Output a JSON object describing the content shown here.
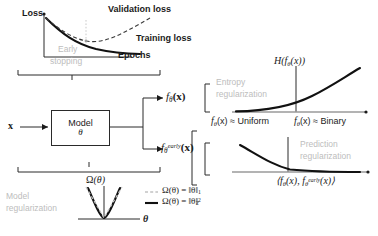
{
  "figure": {
    "panels": {
      "early_stopping": {
        "ylabel": "Loss",
        "xlabel": "Epochs",
        "series": [
          {
            "name": "Validation loss",
            "style": "dashed"
          },
          {
            "name": "Training loss",
            "style": "solid"
          }
        ],
        "marker_label_line1": "Early",
        "marker_label_line2": "stopping"
      },
      "model": {
        "input": "x",
        "box_title": "Model",
        "box_param": "θ",
        "output_top": "f",
        "output_top_sub": "θ",
        "output_top_arg": "(x)",
        "output_bottom": "f",
        "output_bottom_sub": "θ",
        "output_bottom_sup": "early",
        "output_bottom_arg": "(x)"
      },
      "model_regularization": {
        "label_line1": "Model",
        "label_line2": "regularization",
        "ylabel_f": "Ω",
        "ylabel_arg": "(θ)",
        "xlabel": "θ",
        "legend": [
          {
            "style": "dashed",
            "text_f": "Ω(θ)  =  ‖θ‖",
            "sub": "1",
            "sup": ""
          },
          {
            "style": "solid",
            "text_f": "Ω(θ)  =  ‖θ‖",
            "sub": "2",
            "sup": "2"
          }
        ]
      },
      "entropy_regularization": {
        "label_line1": "Entropy",
        "label_line2": "regularization",
        "ylabel_H": "H",
        "ylabel_arg": "(f",
        "ylabel_sub": "θ",
        "ylabel_tail": "(x))",
        "x_left_f": "f",
        "x_left_sub": "θ",
        "x_left_tail": "(x) ≈ Uniform",
        "x_right_f": "f",
        "x_right_sub": "θ",
        "x_right_tail": "(x) ≈ Binary"
      },
      "prediction_regularization": {
        "label_line1": "Prediction",
        "label_line2": "regularization",
        "xlabel_open": "⟨f",
        "xlabel_sub1": "θ",
        "xlabel_mid": "(x), f",
        "xlabel_sub2": "θ",
        "xlabel_sup2": "early",
        "xlabel_close": "(x)⟩"
      }
    },
    "colors": {
      "ink": "#1a1a1a",
      "gray": "#bdbdbd",
      "curve": "#111111",
      "axis": "#888888"
    }
  }
}
